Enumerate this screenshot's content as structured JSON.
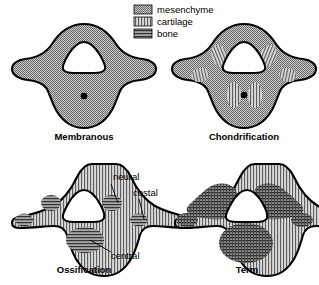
{
  "figure": {
    "background_color": "#ffffff",
    "outline_color": "#000000"
  },
  "legend": {
    "position": "top-center",
    "items": [
      {
        "key": "mesenchyme",
        "label": "mesenchyme",
        "pattern": "stipple-checker",
        "tone": "#9a9a9a"
      },
      {
        "key": "cartilage",
        "label": "cartilage",
        "pattern": "vertical-lines",
        "tone": "#b4b4b4"
      },
      {
        "key": "bone",
        "label": "bone",
        "pattern": "horizontal-lines",
        "tone": "#6e6e6e"
      }
    ]
  },
  "panels": [
    {
      "id": "membranous",
      "caption": "Membranous",
      "position": "top-left",
      "body_tissue": "mesenchyme",
      "has_notochord_dot": true,
      "centers": []
    },
    {
      "id": "chondrification",
      "caption": "Chondrification",
      "position": "top-right",
      "body_tissue": "mesenchyme",
      "has_notochord_dot": true,
      "centers": [
        {
          "name": "neural-left",
          "tissue": "cartilage"
        },
        {
          "name": "neural-right",
          "tissue": "cartilage"
        },
        {
          "name": "costal-left",
          "tissue": "cartilage"
        },
        {
          "name": "costal-right",
          "tissue": "cartilage"
        },
        {
          "name": "transverse-left",
          "tissue": "cartilage"
        },
        {
          "name": "transverse-right",
          "tissue": "cartilage"
        },
        {
          "name": "central-left",
          "tissue": "cartilage"
        },
        {
          "name": "central-right",
          "tissue": "cartilage"
        }
      ]
    },
    {
      "id": "ossification",
      "caption": "Ossification",
      "position": "bottom-left",
      "body_tissue": "cartilage",
      "has_notochord_dot": false,
      "centers": [
        {
          "name": "neural-left",
          "tissue": "bone"
        },
        {
          "name": "neural-right",
          "tissue": "bone"
        },
        {
          "name": "costal-left",
          "tissue": "bone"
        },
        {
          "name": "costal-right",
          "tissue": "bone"
        },
        {
          "name": "central",
          "tissue": "bone"
        }
      ],
      "callouts": [
        {
          "id": "neural",
          "label": "neural"
        },
        {
          "id": "costal",
          "label": "costal"
        },
        {
          "id": "central",
          "label": "central"
        }
      ]
    },
    {
      "id": "term",
      "caption": "Term",
      "position": "bottom-right",
      "body_tissue": "cartilage",
      "has_notochord_dot": false,
      "centers": [
        {
          "name": "neural-left",
          "tissue": "bone"
        },
        {
          "name": "neural-right",
          "tissue": "bone"
        },
        {
          "name": "costal-left",
          "tissue": "bone"
        },
        {
          "name": "costal-right",
          "tissue": "bone"
        },
        {
          "name": "central",
          "tissue": "bone"
        }
      ]
    }
  ]
}
